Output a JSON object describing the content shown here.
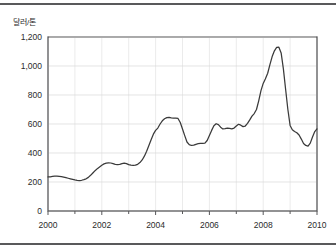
{
  "figure": {
    "y_axis_unit_label": "달러/톤",
    "border_color": "#59595b",
    "line_color": "#3a3a3a",
    "grid_color": "#d9d9d9",
    "background": "#ffffff"
  },
  "chart_data": {
    "type": "line",
    "title": "",
    "subtitle": "",
    "xlabel": "",
    "ylabel": "달러/톤",
    "xlim": [
      2000,
      2010
    ],
    "ylim": [
      0,
      1200
    ],
    "ytick_labels": [
      "0",
      "200",
      "400",
      "600",
      "800",
      "1,000",
      "1,200"
    ],
    "yticks": [
      0,
      200,
      400,
      600,
      800,
      1000,
      1200
    ],
    "xtick_labels": [
      "2000",
      "2002",
      "2004",
      "2006",
      "2008",
      "2010"
    ],
    "xticks": [
      2000,
      2002,
      2004,
      2006,
      2008,
      2010
    ],
    "minor_xticks": [
      2001,
      2003,
      2005,
      2007,
      2009
    ],
    "grid": true,
    "legend": null,
    "legend_position": "none",
    "series": [
      {
        "name": "달러/톤",
        "x": [
          2000.0,
          2000.083,
          2000.167,
          2000.25,
          2000.333,
          2000.417,
          2000.5,
          2000.583,
          2000.667,
          2000.75,
          2000.833,
          2000.917,
          2001.0,
          2001.083,
          2001.167,
          2001.25,
          2001.333,
          2001.417,
          2001.5,
          2001.583,
          2001.667,
          2001.75,
          2001.833,
          2001.917,
          2002.0,
          2002.083,
          2002.167,
          2002.25,
          2002.333,
          2002.417,
          2002.5,
          2002.583,
          2002.667,
          2002.75,
          2002.833,
          2002.917,
          2003.0,
          2003.083,
          2003.167,
          2003.25,
          2003.333,
          2003.417,
          2003.5,
          2003.583,
          2003.667,
          2003.75,
          2003.833,
          2003.917,
          2004.0,
          2004.083,
          2004.167,
          2004.25,
          2004.333,
          2004.417,
          2004.5,
          2004.583,
          2004.667,
          2004.75,
          2004.833,
          2004.917,
          2005.0,
          2005.083,
          2005.167,
          2005.25,
          2005.333,
          2005.417,
          2005.5,
          2005.583,
          2005.667,
          2005.75,
          2005.833,
          2005.917,
          2006.0,
          2006.083,
          2006.167,
          2006.25,
          2006.333,
          2006.417,
          2006.5,
          2006.583,
          2006.667,
          2006.75,
          2006.833,
          2006.917,
          2007.0,
          2007.083,
          2007.167,
          2007.25,
          2007.333,
          2007.417,
          2007.5,
          2007.583,
          2007.667,
          2007.75,
          2007.833,
          2007.917,
          2008.0,
          2008.083,
          2008.167,
          2008.25,
          2008.333,
          2008.417,
          2008.5,
          2008.583,
          2008.667,
          2008.75,
          2008.833,
          2008.917,
          2009.0,
          2009.083,
          2009.167,
          2009.25,
          2009.333,
          2009.417,
          2009.5,
          2009.583,
          2009.667,
          2009.75,
          2009.833,
          2009.917,
          2010.0
        ],
        "values": [
          235,
          236,
          238,
          240,
          241,
          239,
          237,
          234,
          230,
          226,
          222,
          218,
          214,
          211,
          210,
          212,
          216,
          222,
          232,
          246,
          262,
          278,
          292,
          304,
          316,
          325,
          330,
          332,
          331,
          327,
          322,
          320,
          322,
          327,
          330,
          327,
          320,
          316,
          314,
          316,
          322,
          334,
          352,
          378,
          412,
          452,
          492,
          530,
          556,
          572,
          600,
          622,
          636,
          644,
          646,
          642,
          640,
          640,
          638,
          610,
          566,
          520,
          476,
          458,
          452,
          454,
          460,
          464,
          466,
          466,
          468,
          486,
          520,
          556,
          588,
          602,
          596,
          578,
          566,
          568,
          572,
          570,
          566,
          572,
          586,
          598,
          592,
          582,
          586,
          604,
          628,
          654,
          672,
          700,
          760,
          830,
          880,
          912,
          950,
          1010,
          1065,
          1105,
          1128,
          1130,
          1090,
          980,
          840,
          700,
          590,
          560,
          548,
          540,
          524,
          496,
          466,
          452,
          448,
          468,
          510,
          548,
          566
        ]
      }
    ]
  }
}
